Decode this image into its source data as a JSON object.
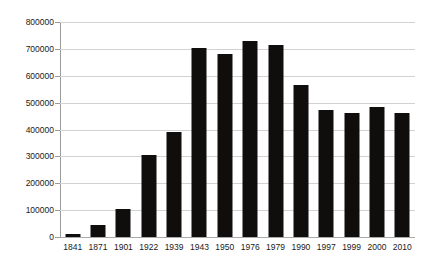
{
  "chart_data": {
    "type": "bar",
    "title": "",
    "subtitle": "",
    "xlabel": "",
    "ylabel": "",
    "categories": [
      "1841",
      "1871",
      "1901",
      "1922",
      "1939",
      "1943",
      "1950",
      "1976",
      "1979",
      "1990",
      "1997",
      "1999",
      "2000",
      "2010"
    ],
    "values": [
      11000,
      45000,
      105000,
      306000,
      391000,
      702000,
      681000,
      731000,
      713000,
      565000,
      472000,
      461000,
      483000,
      463000
    ],
    "ylim": [
      0,
      800000
    ],
    "ytick_labels": [
      "800000",
      "700000",
      "600000",
      "500000",
      "400000",
      "300000",
      "200000",
      "100000",
      "0"
    ],
    "ytick_values": [
      800000,
      700000,
      600000,
      500000,
      400000,
      300000,
      200000,
      100000,
      0
    ],
    "grid": true,
    "legend": false,
    "legend_position": "none",
    "bar_color": "#100d0d",
    "gridline_color": "#d2d2d2",
    "axis_color": "#9a9a9a",
    "background_color": "#ffffff"
  }
}
